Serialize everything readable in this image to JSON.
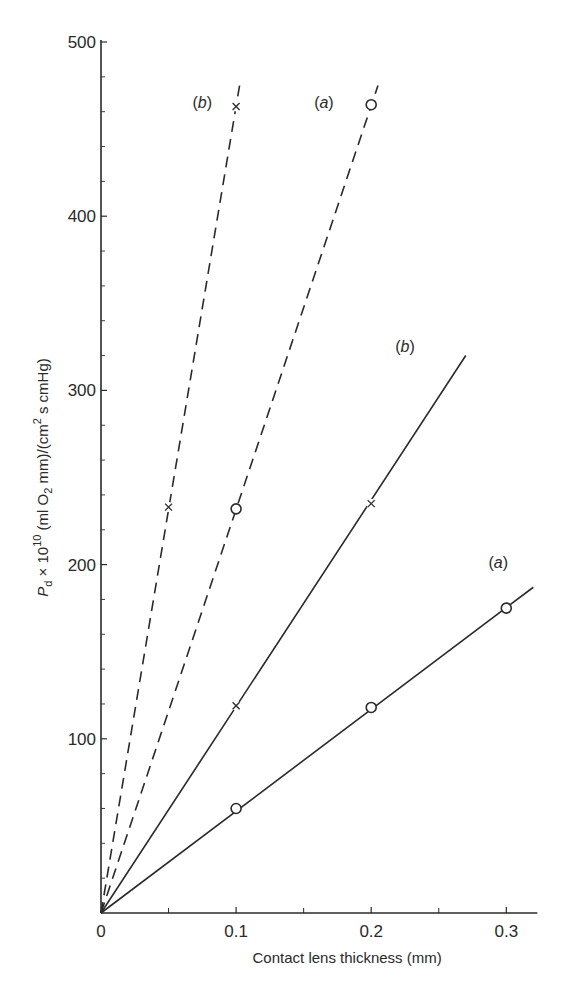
{
  "chart_data": {
    "type": "line",
    "title": "",
    "xlabel": "Contact lens thickness (mm)",
    "ylabel": {
      "prefix": "P",
      "prefix_sub": "d",
      "mid": " × 10",
      "mid_sup": "10",
      "rest1": " (ml O",
      "rest1_sub": "2",
      "rest2": " mm)/(cm",
      "rest2_sup": "2",
      "rest3": " s cmHg)"
    },
    "xlim": [
      0,
      0.32
    ],
    "ylim": [
      0,
      500
    ],
    "x_ticks": [
      {
        "value": 0,
        "label": "0"
      },
      {
        "value": 0.1,
        "label": "0.1"
      },
      {
        "value": 0.2,
        "label": "0.2"
      },
      {
        "value": 0.3,
        "label": "0.3"
      }
    ],
    "x_minor_ticks": [
      0.05,
      0.15,
      0.25
    ],
    "y_ticks": [
      {
        "value": 100,
        "label": "100"
      },
      {
        "value": 200,
        "label": "200"
      },
      {
        "value": 300,
        "label": "300"
      },
      {
        "value": 400,
        "label": "400"
      },
      {
        "value": 500,
        "label": "500"
      }
    ],
    "y_minor_ticks": [
      20,
      40,
      60,
      80,
      120,
      140,
      160,
      180,
      220,
      240,
      260,
      280,
      320,
      340,
      360,
      380,
      420,
      440,
      460,
      480
    ],
    "grid": false,
    "series": [
      {
        "name": "solid-a",
        "label": "a",
        "style": "solid",
        "marker": "circle",
        "points": [
          [
            0.1,
            60
          ],
          [
            0.2,
            118
          ],
          [
            0.3,
            175
          ]
        ],
        "line_end": [
          0.32,
          187
        ],
        "label_at": [
          0.294,
          198
        ]
      },
      {
        "name": "solid-b",
        "label": "b",
        "style": "solid",
        "marker": "cross",
        "points": [
          [
            0.1,
            119
          ],
          [
            0.2,
            235
          ]
        ],
        "line_end": [
          0.27,
          320
        ],
        "label_at": [
          0.225,
          322
        ]
      },
      {
        "name": "dashed-a",
        "label": "a",
        "style": "dashed",
        "marker": "circle",
        "points": [
          [
            0.1,
            232
          ],
          [
            0.2,
            464
          ]
        ],
        "line_end": [
          0.205,
          475
        ],
        "label_at": [
          0.165,
          462
        ]
      },
      {
        "name": "dashed-b",
        "label": "b",
        "style": "dashed",
        "marker": "cross",
        "points": [
          [
            0.05,
            233
          ],
          [
            0.1,
            463
          ]
        ],
        "line_end": [
          0.103,
          477
        ],
        "label_at": [
          0.075,
          462
        ]
      }
    ],
    "colors": {
      "ink": "#2a2a2a",
      "background": "#ffffff"
    }
  }
}
